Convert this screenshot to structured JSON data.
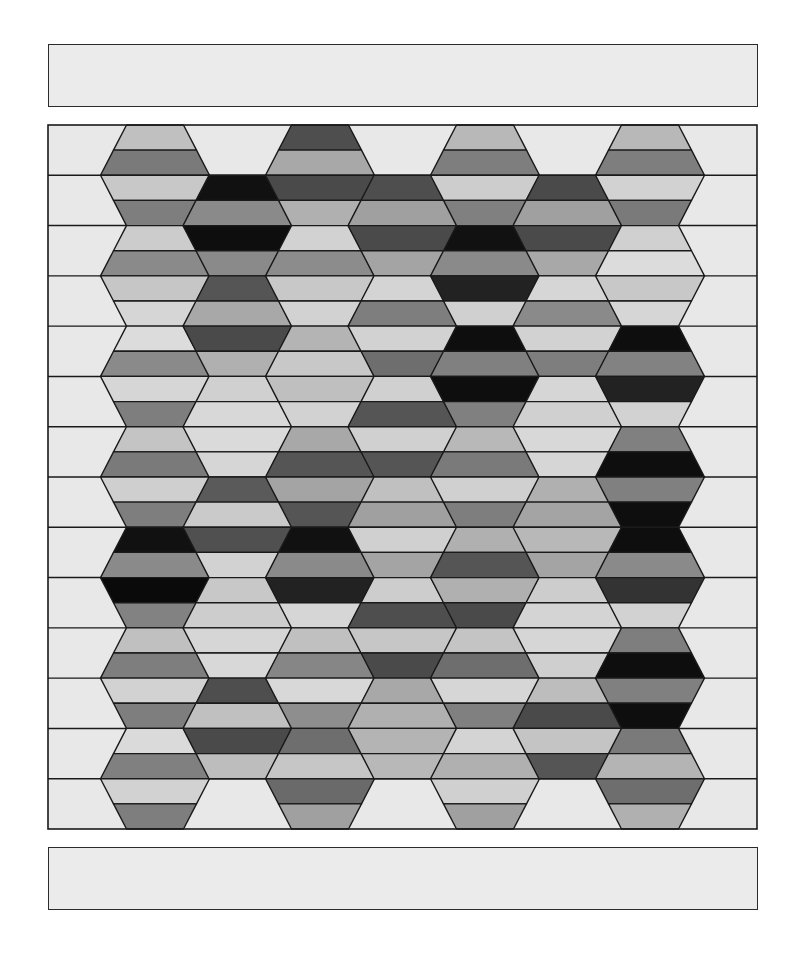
{
  "canvas": {
    "width": 801,
    "height": 969,
    "background": "#ffffff"
  },
  "top_bar": {
    "x": 48,
    "y": 44,
    "width": 710,
    "height": 63,
    "fill": "#ebebeb",
    "stroke": "#2b2b2b"
  },
  "bottom_bar": {
    "x": 48,
    "y": 847,
    "width": 710,
    "height": 63,
    "fill": "#ebebeb",
    "stroke": "#2b2b2b"
  },
  "grid": {
    "x": 48,
    "y": 125,
    "width": 709,
    "height": 704,
    "background": "#e8e8e8",
    "stroke": "#1a1a1a",
    "row_bands": 14,
    "strips": 28,
    "hex_center_x0": 155,
    "hex_spacing_x": 82.5,
    "hex_half_width_edge": 28.5,
    "hex_half_width_mid": 54.5,
    "columns": [
      {
        "k": 0,
        "start_band": 0,
        "strips": [
          "#c0c0c0",
          "#7a7a7a",
          "#c8c8c8",
          "#7e7e7e",
          "#cccccc",
          "#8a8a8a",
          "#c6c6c6",
          "#d6d6d6",
          "#dcdcdc",
          "#8a8a8a",
          "#d6d6d6",
          "#7e7e7e",
          "#c4c4c4",
          "#7a7a7a",
          "#cfcfcf",
          "#7e7e7e",
          "#111111",
          "#8a8a8a",
          "#0a0a0a",
          "#828282",
          "#c0c0c0",
          "#7e7e7e",
          "#d2d2d2",
          "#7e7e7e",
          "#dadada",
          "#808080",
          "#d2d2d2",
          "#7e7e7e"
        ]
      },
      {
        "k": 1,
        "start_band": 1,
        "strips": [
          "#111111",
          "#8a8a8a",
          "#0e0e0e",
          "#8a8a8a",
          "#555555",
          "#a8a8a8",
          "#4a4a4a",
          "#b0b0b0",
          "#d0d0d0",
          "#d8d8d8",
          "#dadada",
          "#d6d6d6",
          "#5a5a5a",
          "#cacaca",
          "#505050",
          "#d2d2d2",
          "#c8c8c8",
          "#cdcdcd",
          "#d6d6d6",
          "#d8d8d8",
          "#4e4e4e",
          "#c0c0c0",
          "#4a4a4a",
          "#bdbdbd"
        ]
      },
      {
        "k": 2,
        "start_band": 0,
        "strips": [
          "#4e4e4e",
          "#a8a8a8",
          "#4a4a4a",
          "#b0b0b0",
          "#d2d2d2",
          "#8c8c8c",
          "#c8c8c8",
          "#d2d2d2",
          "#b4b4b4",
          "#c8c8c8",
          "#bfbfbf",
          "#d2d2d2",
          "#a8a8a8",
          "#555555",
          "#a4a4a4",
          "#555555",
          "#111111",
          "#8a8a8a",
          "#222222",
          "#d6d6d6",
          "#c0c0c0",
          "#868686",
          "#d8d8d8",
          "#8e8e8e",
          "#6e6e6e",
          "#c6c6c6",
          "#6a6a6a",
          "#a0a0a0"
        ]
      },
      {
        "k": 3,
        "start_band": 1,
        "strips": [
          "#4e4e4e",
          "#a0a0a0",
          "#4a4a4a",
          "#a4a4a4",
          "#d4d4d4",
          "#7e7e7e",
          "#d2d2d2",
          "#6e6e6e",
          "#d0d0d0",
          "#555555",
          "#d0d0d0",
          "#555555",
          "#c0c0c0",
          "#a0a0a0",
          "#d0d0d0",
          "#a4a4a4",
          "#cdcdcd",
          "#4e4e4e",
          "#c6c6c6",
          "#4a4a4a",
          "#a8a8a8",
          "#b0b0b0",
          "#b4b4b4",
          "#b8b8b8"
        ]
      },
      {
        "k": 4,
        "start_band": 0,
        "strips": [
          "#b8b8b8",
          "#7e7e7e",
          "#cdcdcd",
          "#808080",
          "#111111",
          "#8a8a8a",
          "#222222",
          "#d0d0d0",
          "#0e0e0e",
          "#808080",
          "#0e0e0e",
          "#808080",
          "#b8b8b8",
          "#7a7a7a",
          "#d0d0d0",
          "#7e7e7e",
          "#b0b0b0",
          "#555555",
          "#b0b0b0",
          "#4a4a4a",
          "#c4c4c4",
          "#6e6e6e",
          "#d6d6d6",
          "#808080",
          "#d4d4d4",
          "#b0b0b0",
          "#d0d0d0",
          "#a0a0a0"
        ]
      },
      {
        "k": 5,
        "start_band": 1,
        "strips": [
          "#4a4a4a",
          "#a0a0a0",
          "#4a4a4a",
          "#a8a8a8",
          "#d6d6d6",
          "#8a8a8a",
          "#d2d2d2",
          "#7e7e7e",
          "#d6d6d6",
          "#d0d0d0",
          "#d8d8d8",
          "#d6d6d6",
          "#b0b0b0",
          "#a4a4a4",
          "#b8b8b8",
          "#a4a4a4",
          "#cdcdcd",
          "#d4d4d4",
          "#d6d6d6",
          "#cfcfcf",
          "#bdbdbd",
          "#4a4a4a",
          "#c4c4c4",
          "#555555"
        ]
      },
      {
        "k": 6,
        "start_band": 0,
        "strips": [
          "#b8b8b8",
          "#7e7e7e",
          "#d2d2d2",
          "#7a7a7a",
          "#d0d0d0",
          "#dcdcdc",
          "#c8c8c8",
          "#d6d6d6",
          "#0e0e0e",
          "#828282",
          "#222222",
          "#d2d2d2",
          "#808080",
          "#0e0e0e",
          "#808080",
          "#0e0e0e",
          "#0e0e0e",
          "#8a8a8a",
          "#333333",
          "#d2d2d2",
          "#7e7e7e",
          "#0e0e0e",
          "#808080",
          "#0e0e0e",
          "#7a7a7a",
          "#b4b4b4",
          "#6e6e6e",
          "#b0b0b0"
        ]
      }
    ]
  }
}
